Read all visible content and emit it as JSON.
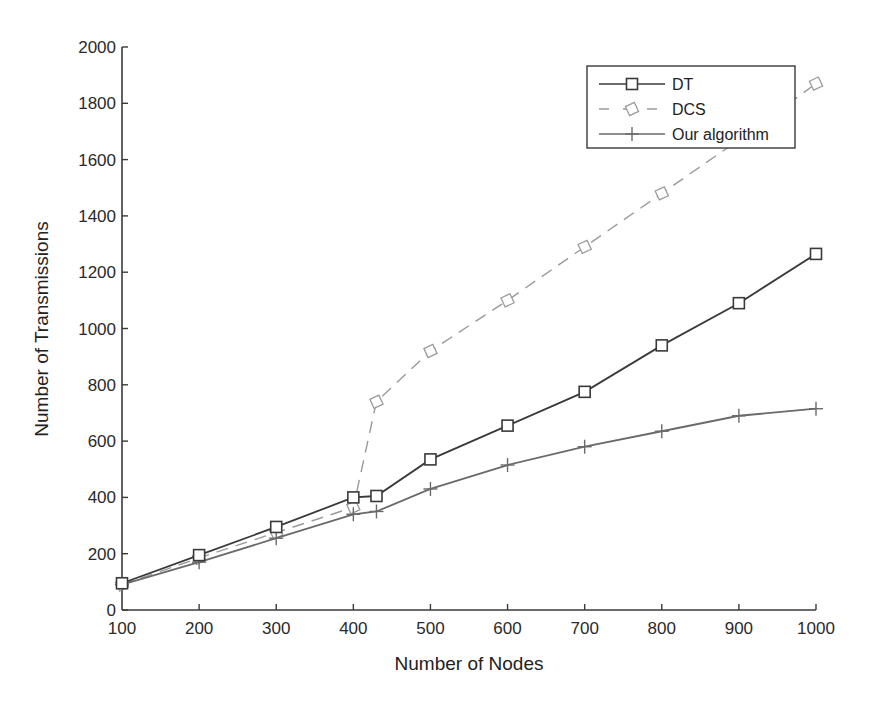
{
  "chart_data": {
    "type": "line",
    "title": "",
    "xlabel": "Number of Nodes",
    "ylabel": "Number of Transmissions",
    "xlim": [
      100,
      1000
    ],
    "ylim": [
      0,
      2000
    ],
    "xticks": [
      100,
      200,
      300,
      400,
      500,
      600,
      700,
      800,
      900,
      1000
    ],
    "yticks": [
      0,
      200,
      400,
      600,
      800,
      1000,
      1200,
      1400,
      1600,
      1800,
      2000
    ],
    "grid": false,
    "legend_position": "top-right",
    "x": [
      100,
      200,
      300,
      400,
      430,
      500,
      600,
      700,
      800,
      900,
      1000
    ],
    "series": [
      {
        "name": "DT",
        "marker": "square",
        "line_style": "solid",
        "color": "#3a3a3a",
        "values": [
          95,
          195,
          295,
          400,
          405,
          535,
          655,
          775,
          940,
          1090,
          1265
        ]
      },
      {
        "name": "DCS",
        "marker": "diamond",
        "line_style": "dashed",
        "color": "#9a9a9a",
        "values": [
          90,
          185,
          275,
          365,
          740,
          920,
          1100,
          1290,
          1480,
          1670,
          1870
        ]
      },
      {
        "name": "Our algorithm",
        "marker": "plus",
        "line_style": "solid",
        "color": "#6a6a6a",
        "values": [
          90,
          170,
          255,
          340,
          350,
          430,
          515,
          580,
          635,
          690,
          715
        ]
      }
    ]
  }
}
